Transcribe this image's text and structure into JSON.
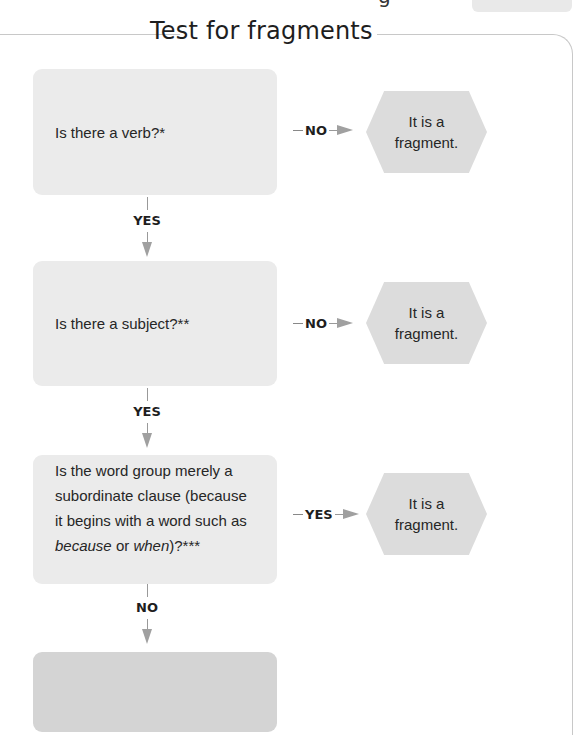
{
  "header": {
    "top_cut_glyph": "g",
    "title": "Test for fragments"
  },
  "flow": {
    "questions": [
      {
        "text": "Is there a verb?*"
      },
      {
        "text": "Is there a subject?**"
      },
      {
        "text_parts": [
          "Is the word group merely a subordinate clause (because it begins with a word such as ",
          "because",
          " or ",
          "when",
          ")?***"
        ]
      },
      {
        "text": ""
      }
    ],
    "outcomes": [
      {
        "line1": "It is a",
        "line2": "fragment."
      },
      {
        "line1": "It is a",
        "line2": "fragment."
      },
      {
        "line1": "It is a",
        "line2": "fragment."
      }
    ],
    "horizontal_connectors": [
      "NO",
      "NO",
      "YES"
    ],
    "vertical_connectors": [
      "YES",
      "YES",
      "NO"
    ]
  },
  "colors": {
    "question_box": "#ebebeb",
    "final_box": "#d4d4d4",
    "hexagon": "#dcdcdc",
    "arrow": "#a0a0a0",
    "frame": "#c8c8c8"
  }
}
